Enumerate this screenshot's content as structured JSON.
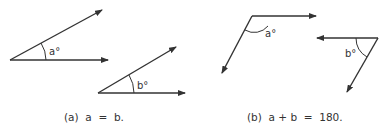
{
  "figure_a": {
    "angle1_label": "a°",
    "angle2_label": "b°",
    "caption": "(a)  a  =  b."
  },
  "figure_b": {
    "angle1_label": "a°",
    "angle2_label": "b°",
    "caption": "(b)  a + b  =  180."
  },
  "colors": {
    "line": "#333333",
    "background": "#ffffff"
  }
}
